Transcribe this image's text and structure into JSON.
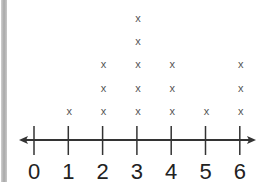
{
  "chart_data": {
    "type": "dot-plot",
    "title": "",
    "xlabel": "",
    "ylabel": "",
    "marker": "x",
    "categories": [
      "0",
      "1",
      "2",
      "3",
      "4",
      "5",
      "6"
    ],
    "x": [
      0,
      1,
      2,
      3,
      4,
      5,
      6
    ],
    "values": [
      0,
      1,
      3,
      5,
      3,
      1,
      3
    ],
    "total_count": 16,
    "xlim": [
      0,
      6
    ],
    "axis": "number line with arrows at both ends",
    "grid": false,
    "legend": null
  },
  "colors": {
    "axis": "#333333",
    "marker": "#555555",
    "label": "#222222",
    "left_border": "#b0b0b0"
  }
}
